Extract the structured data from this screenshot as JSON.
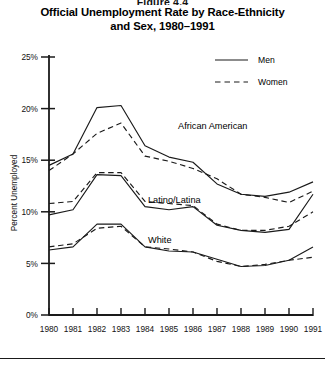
{
  "figure": {
    "number": "Figure 4.4",
    "title_line1": "Official Unemployment Rate by Race-Ethnicity",
    "title_line2": "and Sex, 1980–1991"
  },
  "legend": {
    "position": "top-right",
    "entries": [
      {
        "label": "Men",
        "style": "solid"
      },
      {
        "label": "Women",
        "style": "dashed"
      }
    ]
  },
  "group_labels": [
    {
      "text": "African American",
      "x": 178,
      "y": 129
    },
    {
      "text": "Latino/Latina",
      "x": 148,
      "y": 203
    },
    {
      "text": "White",
      "x": 148,
      "y": 243
    }
  ],
  "axes": {
    "ylabel": "Percent Unemployed",
    "yticks": [
      "0%",
      "5%",
      "10%",
      "15%",
      "20%",
      "25%"
    ],
    "xticks": [
      "1980",
      "1981",
      "1982",
      "1983",
      "1984",
      "1985",
      "1986",
      "1987",
      "1988",
      "1989",
      "1990",
      "1991"
    ]
  },
  "chart_data": {
    "type": "line",
    "title": "Official Unemployment Rate by Race-Ethnicity and Sex, 1980–1991",
    "xlabel": "",
    "ylabel": "Percent Unemployed",
    "x": [
      1980,
      1981,
      1982,
      1983,
      1984,
      1985,
      1986,
      1987,
      1988,
      1989,
      1990,
      1991
    ],
    "ylim": [
      0,
      25
    ],
    "xlim": [
      1980,
      1991
    ],
    "ytick_values": [
      0,
      5,
      10,
      15,
      20,
      25
    ],
    "grid": false,
    "legend": [
      "Men",
      "Women"
    ],
    "legend_position": "top-right",
    "series": [
      {
        "name": "African American Men",
        "group": "African American",
        "sex": "Men",
        "style": "solid",
        "values": [
          14.5,
          15.6,
          20.1,
          20.3,
          16.4,
          15.3,
          14.8,
          12.7,
          11.7,
          11.5,
          11.9,
          12.9
        ]
      },
      {
        "name": "African American Women",
        "group": "African American",
        "sex": "Women",
        "style": "dashed",
        "values": [
          14.0,
          15.6,
          17.6,
          18.6,
          15.4,
          14.9,
          14.2,
          13.2,
          11.7,
          11.4,
          10.9,
          12.0
        ]
      },
      {
        "name": "Latino Men",
        "group": "Latino/Latina",
        "sex": "Men",
        "style": "solid",
        "values": [
          9.7,
          10.2,
          13.6,
          13.5,
          10.5,
          10.2,
          10.5,
          8.7,
          8.2,
          8.0,
          8.3,
          11.7
        ]
      },
      {
        "name": "Latina Women",
        "group": "Latino/Latina",
        "sex": "Women",
        "style": "dashed",
        "values": [
          10.8,
          11.0,
          13.8,
          13.8,
          11.0,
          10.8,
          10.6,
          8.8,
          8.2,
          8.2,
          8.6,
          10.0
        ]
      },
      {
        "name": "White Men",
        "group": "White",
        "sex": "Men",
        "style": "solid",
        "values": [
          6.3,
          6.6,
          8.8,
          8.8,
          6.6,
          6.2,
          6.1,
          5.4,
          4.7,
          4.8,
          5.3,
          6.6
        ]
      },
      {
        "name": "White Women",
        "group": "White",
        "sex": "Women",
        "style": "dashed",
        "values": [
          6.6,
          6.9,
          8.4,
          8.6,
          6.6,
          6.4,
          6.1,
          5.2,
          4.7,
          4.9,
          5.3,
          5.6
        ]
      }
    ]
  }
}
